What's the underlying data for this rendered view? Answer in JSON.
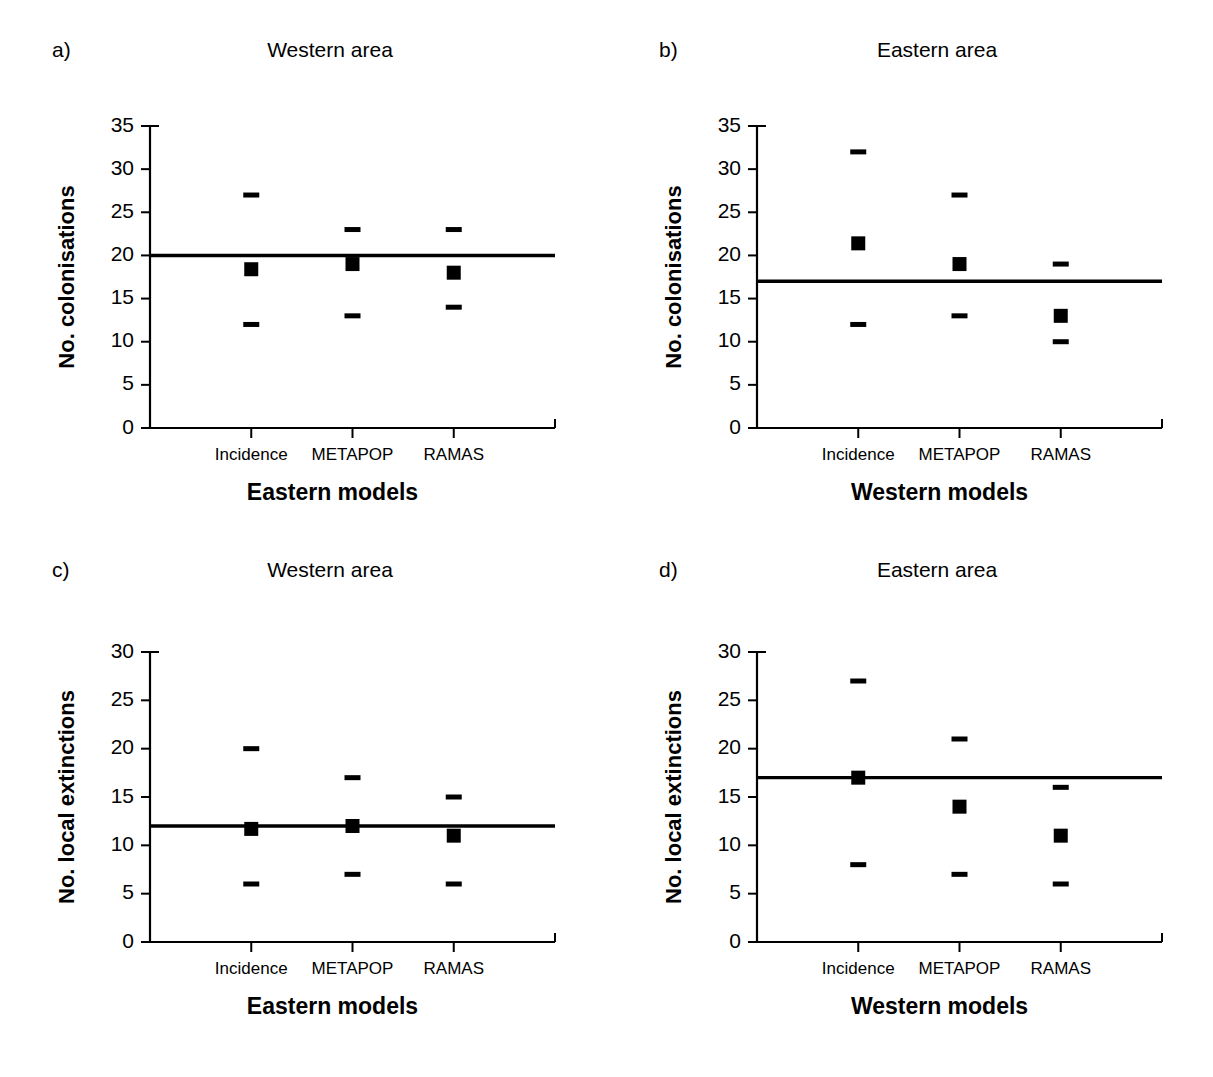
{
  "figure": {
    "background": "#ffffff",
    "ink_color": "#000000",
    "panel_count": 4
  },
  "panels": [
    {
      "letter": "a)",
      "title": "Western area",
      "ylabel": "No. colonisations",
      "xlabel": "Eastern models",
      "ytick_labels": [
        "0",
        "5",
        "10",
        "15",
        "20",
        "25",
        "30",
        "35"
      ],
      "xtick_labels": [
        "Incidence",
        "METAPOP",
        "RAMAS"
      ]
    },
    {
      "letter": "b)",
      "title": "Eastern area",
      "ylabel": "No. colonisations",
      "xlabel": "Western models",
      "ytick_labels": [
        "0",
        "5",
        "10",
        "15",
        "20",
        "25",
        "30",
        "35"
      ],
      "xtick_labels": [
        "Incidence",
        "METAPOP",
        "RAMAS"
      ]
    },
    {
      "letter": "c)",
      "title": "Western area",
      "ylabel": "No. local extinctions",
      "xlabel": "Eastern models",
      "ytick_labels": [
        "0",
        "5",
        "10",
        "15",
        "20",
        "25",
        "30"
      ],
      "xtick_labels": [
        "Incidence",
        "METAPOP",
        "RAMAS"
      ]
    },
    {
      "letter": "d)",
      "title": "Eastern area",
      "ylabel": "No. local extinctions",
      "xlabel": "Western models",
      "ytick_labels": [
        "0",
        "5",
        "10",
        "15",
        "20",
        "25",
        "30"
      ],
      "xtick_labels": [
        "Incidence",
        "METAPOP",
        "RAMAS"
      ]
    }
  ],
  "chart_data": [
    {
      "type": "scatter",
      "panel": "a",
      "title": "Western area",
      "xlabel": "Eastern models",
      "ylabel": "No. colonisations",
      "categories": [
        "Incidence",
        "METAPOP",
        "RAMAS"
      ],
      "values": [
        18.4,
        19.0,
        18.0
      ],
      "upper": [
        27,
        23,
        23
      ],
      "lower": [
        12,
        13,
        14
      ],
      "reference_line": 20,
      "ylim": [
        0,
        35
      ],
      "yticks": [
        0,
        5,
        10,
        15,
        20,
        25,
        30,
        35
      ],
      "grid": false,
      "legend": "none"
    },
    {
      "type": "scatter",
      "panel": "b",
      "title": "Eastern area",
      "xlabel": "Western models",
      "ylabel": "No. colonisations",
      "categories": [
        "Incidence",
        "METAPOP",
        "RAMAS"
      ],
      "values": [
        21.4,
        19.0,
        13.0
      ],
      "upper": [
        32,
        27,
        19
      ],
      "lower": [
        12,
        13,
        10
      ],
      "reference_line": 17,
      "ylim": [
        0,
        35
      ],
      "yticks": [
        0,
        5,
        10,
        15,
        20,
        25,
        30,
        35
      ],
      "grid": false,
      "legend": "none"
    },
    {
      "type": "scatter",
      "panel": "c",
      "title": "Western area",
      "xlabel": "Eastern models",
      "ylabel": "No. local extinctions",
      "categories": [
        "Incidence",
        "METAPOP",
        "RAMAS"
      ],
      "values": [
        11.7,
        12.0,
        11.0
      ],
      "upper": [
        20,
        17,
        15
      ],
      "lower": [
        6,
        7,
        6
      ],
      "reference_line": 12,
      "ylim": [
        0,
        30
      ],
      "yticks": [
        0,
        5,
        10,
        15,
        20,
        25,
        30
      ],
      "grid": false,
      "legend": "none"
    },
    {
      "type": "scatter",
      "panel": "d",
      "title": "Eastern area",
      "xlabel": "Western models",
      "ylabel": "No. local extinctions",
      "categories": [
        "Incidence",
        "METAPOP",
        "RAMAS"
      ],
      "values": [
        17.0,
        14.0,
        11.0
      ],
      "upper": [
        27,
        21,
        16
      ],
      "lower": [
        8,
        7,
        6
      ],
      "reference_line": 17,
      "ylim": [
        0,
        30
      ],
      "yticks": [
        0,
        5,
        10,
        15,
        20,
        25,
        30
      ],
      "grid": false,
      "legend": "none"
    }
  ]
}
